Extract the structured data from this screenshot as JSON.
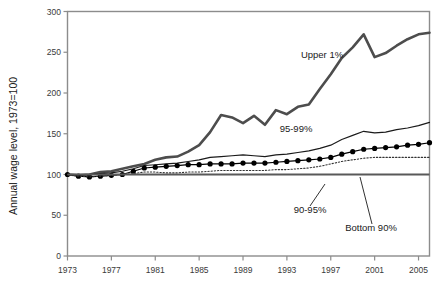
{
  "chart_data": {
    "type": "line",
    "title": "",
    "xlabel": "",
    "ylabel": "Annual wage level, 1973=100",
    "xlim": [
      1973,
      2006
    ],
    "ylim": [
      0,
      300
    ],
    "grid": false,
    "legend_position": "inline-annotations",
    "x_ticks": [
      "1973",
      "1977",
      "1981",
      "1985",
      "1989",
      "1993",
      "1997",
      "2001",
      "2005"
    ],
    "x_tick_values": [
      1973,
      1977,
      1981,
      1985,
      1989,
      1993,
      1997,
      2001,
      2005
    ],
    "y_ticks": [
      "0",
      "50",
      "100",
      "150",
      "200",
      "250",
      "300"
    ],
    "y_tick_values": [
      0,
      50,
      100,
      150,
      200,
      250,
      300
    ],
    "x": [
      1973,
      1974,
      1975,
      1976,
      1977,
      1978,
      1979,
      1980,
      1981,
      1982,
      1983,
      1984,
      1985,
      1986,
      1987,
      1988,
      1989,
      1990,
      1991,
      1992,
      1993,
      1994,
      1995,
      1996,
      1997,
      1998,
      1999,
      2000,
      2001,
      2002,
      2003,
      2004,
      2005,
      2006
    ],
    "series": [
      {
        "name": "Upper 1%",
        "label": "Upper 1%",
        "style": "thick-solid",
        "color": "#4d4d4d",
        "values": [
          100,
          99,
          100,
          103,
          104,
          107,
          110,
          113,
          118,
          121,
          122,
          128,
          136,
          152,
          173,
          170,
          163,
          172,
          161,
          179,
          174,
          183,
          186,
          205,
          223,
          243,
          256,
          272,
          244,
          249,
          258,
          266,
          272,
          274
        ]
      },
      {
        "name": "95-99%",
        "label": "95-99%",
        "style": "thin-solid",
        "color": "#1a1a1a",
        "values": [
          100,
          99,
          100,
          101,
          102,
          104,
          107,
          111,
          112,
          113,
          114,
          116,
          118,
          121,
          122,
          123,
          124,
          123,
          122,
          124,
          125,
          127,
          129,
          132,
          136,
          143,
          148,
          153,
          151,
          152,
          155,
          157,
          160,
          164
        ]
      },
      {
        "name": "90-95%",
        "label": "90-95%",
        "style": "markers",
        "color": "#000000",
        "values": [
          100,
          98,
          97,
          98,
          99,
          100,
          104,
          108,
          109,
          110,
          111,
          112,
          112,
          113,
          113,
          113,
          114,
          114,
          114,
          115,
          116,
          117,
          118,
          119,
          121,
          125,
          128,
          131,
          132,
          133,
          134,
          136,
          137,
          139
        ]
      },
      {
        "name": "Bottom 90%",
        "label": "Bottom 90%",
        "style": "dotted",
        "color": "#333333",
        "values": [
          100,
          98,
          97,
          98,
          99,
          100,
          101,
          103,
          103,
          102,
          102,
          103,
          103,
          104,
          105,
          105,
          105,
          105,
          105,
          106,
          106,
          107,
          108,
          110,
          113,
          116,
          118,
          120,
          121,
          121,
          121,
          121,
          121,
          121
        ]
      }
    ],
    "annotations": [
      {
        "text": "Upper 1%",
        "x": 322,
        "y": 58,
        "leader": false
      },
      {
        "text": "95-99%",
        "x": 296,
        "y": 132,
        "leader": false
      },
      {
        "text": "90-95%",
        "x": 310,
        "y": 213,
        "leader": true
      },
      {
        "text": "Bottom 90%",
        "x": 371,
        "y": 231,
        "leader": true
      }
    ]
  },
  "axes": {
    "frame_color": "#8c8c8c",
    "baseline_color": "#595959"
  }
}
